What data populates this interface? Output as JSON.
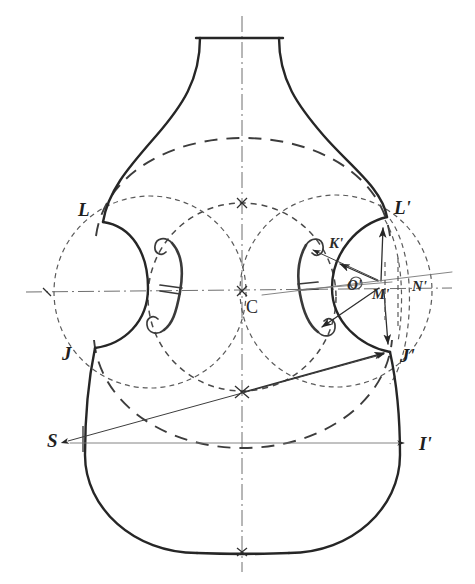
{
  "figure": {
    "kind": "geometric-construction-drawing",
    "background_color": "#ffffff",
    "ink_color": "#262626",
    "width": 475,
    "height": 584
  },
  "labels": [
    {
      "id": "L",
      "text": "L",
      "x": 78,
      "y": 216,
      "size": "large"
    },
    {
      "id": "J",
      "text": "J",
      "x": 62,
      "y": 360,
      "size": "large"
    },
    {
      "id": "S",
      "text": "S",
      "x": 47,
      "y": 445,
      "size": "large"
    },
    {
      "id": "C",
      "text": "C",
      "x": 246,
      "y": 312,
      "size": "large"
    },
    {
      "id": "Lp",
      "text": "L'",
      "x": 394,
      "y": 214,
      "size": "large"
    },
    {
      "id": "Kp",
      "text": "K'",
      "x": 329,
      "y": 246,
      "size": "small"
    },
    {
      "id": "Op",
      "text": "O'",
      "x": 351,
      "y": 288,
      "size": "small"
    },
    {
      "id": "Mp",
      "text": "M'",
      "x": 376,
      "y": 295,
      "size": "small"
    },
    {
      "id": "Np",
      "text": "N'",
      "x": 414,
      "y": 288,
      "size": "small"
    },
    {
      "id": "Jp",
      "text": "J'",
      "x": 400,
      "y": 361,
      "size": "large"
    },
    {
      "id": "Ip",
      "text": "I'",
      "x": 419,
      "y": 448,
      "size": "large"
    }
  ],
  "construction": {
    "center_point": {
      "name": "C",
      "x": 242,
      "y": 291
    },
    "upper_node": {
      "x": 242,
      "y": 203
    },
    "lower_node": {
      "x": 242,
      "y": 391
    },
    "vertical_axis": {
      "x": 242,
      "y_top": 16,
      "y_bottom": 572
    },
    "horizontal_axis": {
      "y": 291,
      "x_left": 26,
      "x_right": 452
    },
    "points": {
      "L": {
        "x": 103,
        "y": 222
      },
      "Lp": {
        "x": 387,
        "y": 217
      },
      "J": {
        "x": 95,
        "y": 348
      },
      "Jp": {
        "x": 390,
        "y": 352
      },
      "S": {
        "x": 66,
        "y": 440
      },
      "Ip": {
        "x": 405,
        "y": 443
      },
      "Kp": {
        "x": 342,
        "y": 258
      },
      "Op": {
        "x": 357,
        "y": 283
      },
      "Mp": {
        "x": 381,
        "y": 284
      },
      "Np": {
        "x": 408,
        "y": 283
      }
    },
    "circles": [
      {
        "name": "central-dashed-circle",
        "cx": 242,
        "cy": 291,
        "r": 92,
        "style": "dash-short"
      },
      {
        "name": "left-bout-dashed-circle",
        "cx": 148,
        "cy": 293,
        "r": 95,
        "style": "dash-fine"
      },
      {
        "name": "right-bout-dashed-circle",
        "cx": 337,
        "cy": 291,
        "r": 95,
        "style": "dash-fine"
      },
      {
        "name": "upper-dashed-arc",
        "cx": 242,
        "cy": 330,
        "r": 150,
        "style": "dash-long"
      },
      {
        "name": "lower-dashed-arc",
        "cx": 242,
        "cy": 250,
        "r": 205,
        "style": "dash-long"
      }
    ]
  },
  "annotations": {
    "arrow_Mp_to_Lp": "ray from M' up to L'",
    "arrow_Mp_to_Jp": "ray from M' down to J'",
    "arrow_Mp_to_Kp": "ray from M' to K'",
    "arrow_Mp_to_fhole_lower": "ray from M' to lower f-hole eye",
    "arrow_S_to_Jp": "long arrow from S to J'",
    "arrow_S_to_Ip": "horizontal arrow from S to I'",
    "arrow_lowernode_to_Jp": "arrow from lower node to J'"
  },
  "fholes": {
    "left": {
      "cx": 170,
      "cy": 283,
      "height": 90
    },
    "right": {
      "cx": 313,
      "cy": 285,
      "height": 92
    }
  }
}
